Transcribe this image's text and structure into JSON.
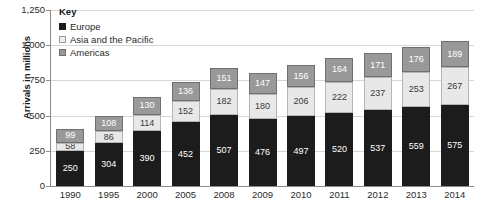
{
  "chart_data": {
    "type": "bar",
    "subtype": "stacked-bar",
    "title": "",
    "xlabel": "",
    "ylabel": "Arrivals in millions",
    "ylim": [
      0,
      1250
    ],
    "yticks": [
      0,
      250,
      500,
      750,
      1000,
      1250
    ],
    "ytick_labels": [
      "0",
      "250",
      "500",
      "750",
      "1,000",
      "1,250"
    ],
    "grid": true,
    "legend_position": "top-left-inside",
    "legend_title": "Key",
    "categories": [
      "1990",
      "1995",
      "2000",
      "2005",
      "2008",
      "2009",
      "2010",
      "2011",
      "2012",
      "2013",
      "2014"
    ],
    "series": [
      {
        "name": "Europe",
        "color": "#1c1c1c",
        "values": [
          250,
          304,
          390,
          452,
          507,
          476,
          497,
          520,
          537,
          559,
          575
        ]
      },
      {
        "name": "Asia and the Pacific",
        "color": "#e8e8e8",
        "values": [
          58,
          86,
          114,
          152,
          182,
          180,
          206,
          222,
          237,
          253,
          267
        ]
      },
      {
        "name": "Americas",
        "color": "#999999",
        "values": [
          99,
          108,
          130,
          136,
          151,
          147,
          156,
          164,
          171,
          176,
          189
        ]
      }
    ],
    "totals": [
      407,
      498,
      634,
      740,
      840,
      803,
      859,
      906,
      945,
      988,
      1031
    ]
  },
  "top_caption": "",
  "legend": {
    "title": "Key",
    "items": [
      {
        "label": "Europe",
        "swatch": "europe-swatch"
      },
      {
        "label": "Asia and the Pacific",
        "swatch": "asia-swatch"
      },
      {
        "label": "Americas",
        "swatch": "americas-swatch"
      }
    ]
  },
  "axes": {
    "y_title": "Arrivals in millions",
    "y_tick_labels": [
      "1,250",
      "1,000",
      "750",
      "500",
      "250",
      "0"
    ],
    "x_tick_labels": [
      "1990",
      "1995",
      "2000",
      "2005",
      "2008",
      "2009",
      "2010",
      "2011",
      "2012",
      "2013",
      "2014"
    ]
  },
  "colors": {
    "europe": "#1c1c1c",
    "asia": "#e8e8e8",
    "americas": "#999999",
    "gridline": "#d6d6d6",
    "axis": "#8c8c8c",
    "text": "#2b2b2b"
  }
}
